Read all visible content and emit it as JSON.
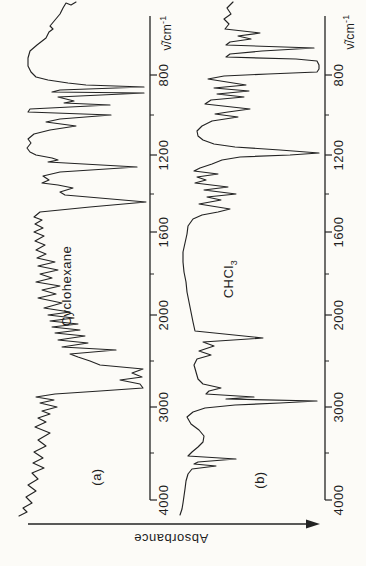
{
  "figure": {
    "type": "scanned infrared spectra figure, rotated 90 degrees counterclockwise",
    "absorbance_axis_label": "Absorbance",
    "axis_title_main": "ν̃/cm",
    "axis_title_exponent": "-1",
    "panels": [
      {
        "tag": "(a)",
        "compound": "Cyclohexane",
        "compound_subscript": ""
      },
      {
        "tag": "(b)",
        "compound": "CHCl",
        "compound_subscript": "3"
      }
    ]
  },
  "chart_data": {
    "type": "line",
    "xlabel": "ν̃/cm⁻¹ (wavenumber, runs vertically in rotated figure; 4000 at bottom, ~620 at top)",
    "ylabel": "Absorbance (increases toward arrowhead, horizontal in rotated figure)",
    "axis_ticks_cm1": [
      800,
      1200,
      1600,
      2000,
      3000,
      4000
    ],
    "axis_note": "dual-linear abscissa, scale expanded x2 below 2000 cm-1",
    "wavenumber_tick_labels": [
      "800",
      "1200",
      "1600",
      "2000",
      "3000",
      "4000"
    ],
    "major_tick_y": [
      75,
      155,
      232,
      315,
      407,
      500
    ],
    "minor_tick_y": [
      115,
      194,
      274,
      361,
      453
    ],
    "axis_top_y": 16,
    "axis_bottom_y": 500,
    "series": [
      {
        "name": "Cyclohexane",
        "major_bands_cm1_relA": [
          [
            2930,
            1.0
          ],
          [
            2855,
            0.95
          ],
          [
            2660,
            0.6
          ],
          [
            1450,
            0.9
          ],
          [
            1260,
            0.75
          ],
          [
            1038,
            0.55
          ],
          [
            1015,
            0.55
          ],
          [
            905,
            0.9
          ],
          [
            860,
            0.85
          ]
        ]
      },
      {
        "name": "CHCl3",
        "major_bands_cm1_relA": [
          [
            3680,
            0.35
          ],
          [
            3605,
            0.3
          ],
          [
            3020,
            0.9
          ],
          [
            2400,
            0.5
          ],
          [
            1420,
            0.35
          ],
          [
            1215,
            1.0
          ],
          [
            940,
            0.4
          ],
          [
            756,
            1.0
          ],
          [
            667,
            0.85
          ],
          [
            620,
            0.4
          ]
        ]
      }
    ],
    "panels": [
      {
        "axis_x": 150,
        "label_x": 163,
        "title_center": [
          166,
          33
        ],
        "trace_px": [
          [
            76,
            2
          ],
          [
            71,
            5
          ],
          [
            66,
            3
          ],
          [
            63,
            8
          ],
          [
            60,
            14
          ],
          [
            55,
            20
          ],
          [
            50,
            26
          ],
          [
            53,
            29
          ],
          [
            49,
            32
          ],
          [
            46,
            38
          ],
          [
            37,
            45
          ],
          [
            30,
            51
          ],
          [
            28,
            58
          ],
          [
            28,
            66
          ],
          [
            31,
            72
          ],
          [
            36,
            77
          ],
          [
            48,
            80
          ],
          [
            68,
            83
          ],
          [
            86,
            85
          ],
          [
            144,
            87
          ],
          [
            60,
            90
          ],
          [
            52,
            92
          ],
          [
            144,
            93
          ],
          [
            58,
            97
          ],
          [
            66,
            99
          ],
          [
            74,
            101
          ],
          [
            64,
            103
          ],
          [
            110,
            105
          ],
          [
            30,
            109
          ],
          [
            28,
            112
          ],
          [
            111,
            115
          ],
          [
            60,
            119
          ],
          [
            46,
            122
          ],
          [
            76,
            126
          ],
          [
            50,
            130
          ],
          [
            34,
            134
          ],
          [
            28,
            139
          ],
          [
            31,
            143
          ],
          [
            27,
            148
          ],
          [
            30,
            152
          ],
          [
            36,
            155
          ],
          [
            52,
            158
          ],
          [
            58,
            160
          ],
          [
            48,
            162
          ],
          [
            137,
            167
          ],
          [
            60,
            172
          ],
          [
            43,
            176
          ],
          [
            49,
            180
          ],
          [
            42,
            183
          ],
          [
            58,
            185
          ],
          [
            73,
            188
          ],
          [
            60,
            192
          ],
          [
            65,
            195
          ],
          [
            146,
            202
          ],
          [
            90,
            207
          ],
          [
            40,
            212
          ],
          [
            34,
            217
          ],
          [
            42,
            220
          ],
          [
            35,
            224
          ],
          [
            43,
            228
          ],
          [
            34,
            232
          ],
          [
            44,
            236
          ],
          [
            35,
            241
          ],
          [
            45,
            245
          ],
          [
            36,
            250
          ],
          [
            46,
            254
          ],
          [
            37,
            258
          ],
          [
            55,
            262
          ],
          [
            38,
            266
          ],
          [
            58,
            270
          ],
          [
            40,
            274
          ],
          [
            52,
            278
          ],
          [
            36,
            282
          ],
          [
            60,
            286
          ],
          [
            42,
            290
          ],
          [
            56,
            294
          ],
          [
            38,
            298
          ],
          [
            62,
            303
          ],
          [
            44,
            308
          ],
          [
            70,
            312
          ],
          [
            48,
            315
          ],
          [
            74,
            318
          ],
          [
            50,
            321
          ],
          [
            78,
            324
          ],
          [
            52,
            327
          ],
          [
            80,
            330
          ],
          [
            55,
            333
          ],
          [
            85,
            336
          ],
          [
            58,
            340
          ],
          [
            88,
            343
          ],
          [
            62,
            347
          ],
          [
            116,
            350
          ],
          [
            70,
            354
          ],
          [
            78,
            357
          ],
          [
            90,
            361
          ],
          [
            100,
            365
          ],
          [
            143,
            369
          ],
          [
            132,
            373
          ],
          [
            142,
            377
          ],
          [
            120,
            380
          ],
          [
            140,
            384
          ],
          [
            143,
            388
          ],
          [
            100,
            391
          ],
          [
            55,
            394
          ],
          [
            36,
            397
          ],
          [
            54,
            400
          ],
          [
            40,
            403
          ],
          [
            57,
            407
          ],
          [
            42,
            411
          ],
          [
            50,
            414
          ],
          [
            38,
            418
          ],
          [
            46,
            422
          ],
          [
            35,
            427
          ],
          [
            50,
            433
          ],
          [
            38,
            440
          ],
          [
            46,
            446
          ],
          [
            34,
            452
          ],
          [
            43,
            458
          ],
          [
            33,
            463
          ],
          [
            44,
            468
          ],
          [
            32,
            473
          ],
          [
            38,
            479
          ],
          [
            28,
            485
          ],
          [
            36,
            491
          ],
          [
            26,
            497
          ],
          [
            32,
            503
          ],
          [
            23,
            508
          ],
          [
            27,
            512
          ],
          [
            19,
            516
          ]
        ]
      },
      {
        "axis_x": 325,
        "label_x": 338,
        "title_center": [
          349,
          32
        ],
        "trace_px": [
          [
            233,
            2
          ],
          [
            227,
            8
          ],
          [
            231,
            14
          ],
          [
            224,
            19
          ],
          [
            229,
            24
          ],
          [
            225,
            29
          ],
          [
            260,
            33
          ],
          [
            238,
            36
          ],
          [
            251,
            39
          ],
          [
            230,
            42
          ],
          [
            226,
            45
          ],
          [
            314,
            48
          ],
          [
            262,
            51
          ],
          [
            230,
            54
          ],
          [
            226,
            57
          ],
          [
            296,
            59
          ],
          [
            317,
            61
          ],
          [
            319,
            65
          ],
          [
            319,
            69
          ],
          [
            317,
            72
          ],
          [
            268,
            74
          ],
          [
            224,
            76
          ],
          [
            208,
            79
          ],
          [
            246,
            85
          ],
          [
            214,
            88
          ],
          [
            249,
            91
          ],
          [
            217,
            94
          ],
          [
            244,
            97
          ],
          [
            211,
            100
          ],
          [
            205,
            104
          ],
          [
            250,
            109
          ],
          [
            228,
            112
          ],
          [
            215,
            114
          ],
          [
            238,
            117
          ],
          [
            212,
            121
          ],
          [
            202,
            126
          ],
          [
            197,
            131
          ],
          [
            198,
            136
          ],
          [
            203,
            140
          ],
          [
            214,
            144
          ],
          [
            235,
            147
          ],
          [
            280,
            150
          ],
          [
            319,
            153
          ],
          [
            290,
            155
          ],
          [
            240,
            157
          ],
          [
            222,
            160
          ],
          [
            212,
            164
          ],
          [
            200,
            168
          ],
          [
            194,
            171
          ],
          [
            218,
            174
          ],
          [
            197,
            177
          ],
          [
            206,
            180
          ],
          [
            195,
            183
          ],
          [
            228,
            187
          ],
          [
            204,
            190
          ],
          [
            236,
            194
          ],
          [
            207,
            197
          ],
          [
            221,
            200
          ],
          [
            199,
            204
          ],
          [
            230,
            209
          ],
          [
            218,
            212
          ],
          [
            202,
            215
          ],
          [
            193,
            219
          ],
          [
            188,
            226
          ],
          [
            187,
            234
          ],
          [
            185,
            243
          ],
          [
            183,
            252
          ],
          [
            183,
            262
          ],
          [
            184,
            272
          ],
          [
            186,
            282
          ],
          [
            187,
            292
          ],
          [
            189,
            302
          ],
          [
            191,
            312
          ],
          [
            193,
            322
          ],
          [
            195,
            331
          ],
          [
            263,
            338
          ],
          [
            203,
            342
          ],
          [
            214,
            346
          ],
          [
            199,
            351
          ],
          [
            211,
            355
          ],
          [
            197,
            359
          ],
          [
            194,
            365
          ],
          [
            196,
            372
          ],
          [
            198,
            379
          ],
          [
            203,
            384
          ],
          [
            221,
            388
          ],
          [
            209,
            391
          ],
          [
            206,
            394
          ],
          [
            254,
            397
          ],
          [
            226,
            399
          ],
          [
            317,
            401
          ],
          [
            280,
            403
          ],
          [
            235,
            405
          ],
          [
            205,
            408
          ],
          [
            193,
            412
          ],
          [
            187,
            417
          ],
          [
            191,
            424
          ],
          [
            199,
            430
          ],
          [
            204,
            436
          ],
          [
            203,
            442
          ],
          [
            198,
            447
          ],
          [
            192,
            452
          ],
          [
            188,
            456
          ],
          [
            236,
            459
          ],
          [
            198,
            462
          ],
          [
            194,
            464
          ],
          [
            216,
            466
          ],
          [
            192,
            469
          ],
          [
            188,
            474
          ],
          [
            186,
            481
          ],
          [
            185,
            489
          ],
          [
            184,
            496
          ],
          [
            183,
            503
          ],
          [
            182,
            509
          ],
          [
            180,
            515
          ]
        ]
      }
    ],
    "absorbance_arrow": {
      "x1": 28,
      "x2": 307,
      "tip_x": 320,
      "y": 524
    },
    "stroke_color": "#232323"
  }
}
